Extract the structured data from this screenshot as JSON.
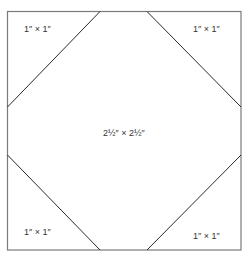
{
  "diagram": {
    "type": "quilt-block",
    "colors": {
      "outline": "#7a7a7a",
      "diagonal": "#2a2a2a",
      "text": "#333333",
      "background": "#ffffff"
    },
    "outer_square": {
      "x": 7,
      "y": 11,
      "width": 234,
      "height": 239
    },
    "center_label": "2½″ × 2½″",
    "corners": [
      {
        "position": "top-left",
        "label": "1″ × 1″"
      },
      {
        "position": "top-right",
        "label": "1″ × 1″"
      },
      {
        "position": "bottom-left",
        "label": "1″ × 1″"
      },
      {
        "position": "bottom-right",
        "label": "1″ × 1″"
      }
    ]
  }
}
